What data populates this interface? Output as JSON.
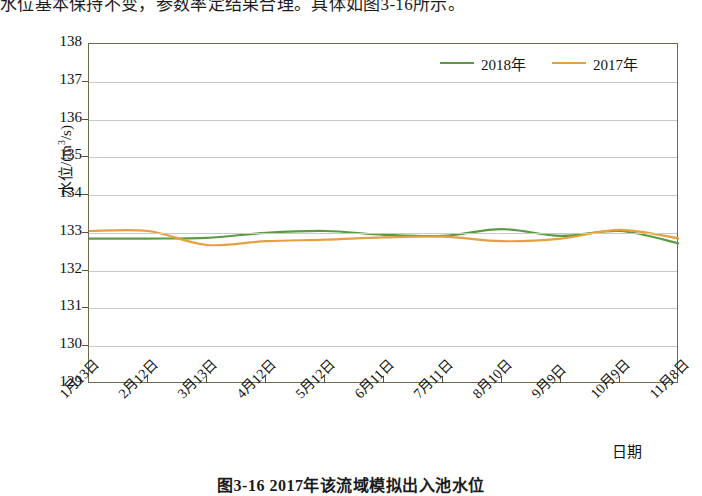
{
  "document": {
    "top_text": "水位基本保持不变，参数率定结果合理。具体如图3-16所示。",
    "caption": "图3-16  2017年该流域模拟出入池水位"
  },
  "chart_data": {
    "type": "line",
    "title": "",
    "xlabel": "日期",
    "ylabel": "水位/(m³/s)",
    "ylim": [
      129,
      138
    ],
    "yticks": [
      129,
      130,
      131,
      132,
      133,
      134,
      135,
      136,
      137,
      138
    ],
    "grid": true,
    "legend_position": "top-right",
    "categories": [
      "1月13日",
      "2月12日",
      "3月13日",
      "4月12日",
      "5月12日",
      "6月11日",
      "7月11日",
      "8月10日",
      "9月9日",
      "10月9日",
      "11月8日"
    ],
    "series": [
      {
        "name": "2018年",
        "color": "#5d9a46",
        "values": [
          132.85,
          132.85,
          132.87,
          133.0,
          133.05,
          132.95,
          132.92,
          133.1,
          132.92,
          133.05,
          132.72
        ]
      },
      {
        "name": "2017年",
        "color": "#e6a042",
        "values": [
          133.05,
          133.05,
          132.68,
          132.78,
          132.82,
          132.88,
          132.9,
          132.78,
          132.85,
          133.08,
          132.85
        ]
      }
    ]
  },
  "legend": {
    "items": [
      {
        "label": "2018年",
        "color": "#5d9a46"
      },
      {
        "label": "2017年",
        "color": "#e6a042"
      }
    ]
  }
}
